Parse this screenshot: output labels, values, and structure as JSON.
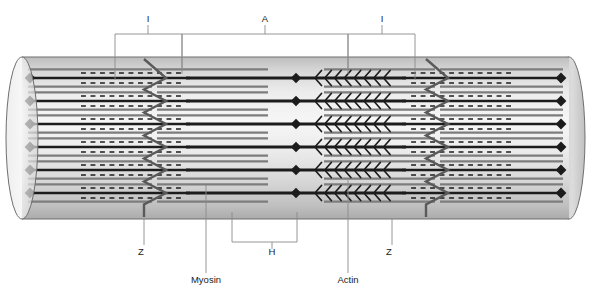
{
  "figure": {
    "type": "biological-diagram",
    "background_color": "#ffffff"
  },
  "labels": {
    "band_i_left": "I",
    "band_a": "A",
    "band_i_right": "I",
    "zone_h": "H",
    "zline_left": "Z",
    "zline_right": "Z",
    "myosin": "Myosin",
    "actin": "Actin"
  },
  "caption": {
    "text": ""
  },
  "colors": {
    "cylinder_light": "#f2f2f2",
    "cylinder_mid": "#d4d4d4",
    "cylinder_dark": "#b0b0b0",
    "cylinder_outline": "#6f6f6f",
    "myosin": "#1c1c1c",
    "actin": "#7d7d7d",
    "zline": "#5a5a5a",
    "leader": "#8a8a8a",
    "text": "#1a1a1a"
  },
  "geometry": {
    "cylinder": {
      "left_x": 22,
      "right_x": 569,
      "top_y": 57,
      "bottom_y": 219,
      "cap_rx": 16,
      "cap_ry": 81
    },
    "rows": {
      "count": 6,
      "y_positions": [
        78,
        101,
        124,
        147,
        170,
        193
      ]
    },
    "zlines": {
      "left_x": 155,
      "right_x": 437,
      "zigzag_half_width": 11
    },
    "mline_x": 296,
    "myosin": {
      "left_start": 190,
      "left_end": 296,
      "right_start": 296,
      "right_end": 402,
      "thickness": 3.2,
      "node_radius": 5.2
    },
    "actin": {
      "thickness": 2.3,
      "left_outer_start": 62,
      "left_inner_end": 268,
      "right_inner_start": 324,
      "right_outer_end": 530
    }
  },
  "bands": [
    {
      "name": "I",
      "label": "I",
      "x_start": 115,
      "x_end": 182,
      "bracket_y": 34,
      "tick_x": 148,
      "text_x": 148,
      "text_y": 22
    },
    {
      "name": "A",
      "label": "A",
      "x_start": 182,
      "x_end": 348,
      "bracket_y": 34,
      "tick_x": 265,
      "text_x": 265,
      "text_y": 22
    },
    {
      "name": "I",
      "label": "I",
      "x_start": 348,
      "x_end": 415,
      "bracket_y": 34,
      "tick_x": 382,
      "text_x": 382,
      "text_y": 22
    }
  ],
  "callouts": [
    {
      "name": "z-left",
      "label": "Z",
      "text_x": 141,
      "text_y": 255,
      "line": [
        [
          144,
          219
        ],
        [
          144,
          245
        ]
      ]
    },
    {
      "name": "z-right",
      "label": "Z",
      "text_x": 389,
      "text_y": 255,
      "line": [
        [
          392,
          219
        ],
        [
          392,
          245
        ]
      ]
    },
    {
      "name": "myosin",
      "label": "Myosin",
      "text_x": 206,
      "text_y": 283,
      "line": [
        [
          206,
          185
        ],
        [
          206,
          273
        ]
      ]
    },
    {
      "name": "actin",
      "label": "Actin",
      "text_x": 348,
      "text_y": 283,
      "line": [
        [
          348,
          180
        ],
        [
          348,
          273
        ]
      ]
    },
    {
      "name": "h-zone",
      "label": "H",
      "text_x": 272,
      "text_y": 255,
      "bracket": {
        "x_start": 232,
        "x_end": 297,
        "y": 242,
        "tick_x": 272
      }
    }
  ]
}
